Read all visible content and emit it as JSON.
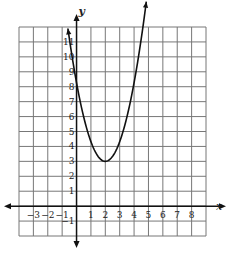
{
  "chart_data": {
    "type": "line",
    "title": "",
    "xlabel": "x",
    "ylabel": "y",
    "function_description": "parabola opening upward with vertex at (2, 3)",
    "vertex": [
      2,
      3
    ],
    "x": [
      -0.6,
      -0.25,
      0,
      0.5,
      1,
      1.5,
      2,
      2.5,
      3,
      3.5,
      4,
      4.5,
      4.85
    ],
    "y": [
      11.9,
      10.0,
      7.0,
      5.25,
      4.0,
      3.25,
      3.0,
      3.25,
      4.0,
      5.25,
      7.0,
      9.25,
      11.9
    ],
    "x_ticks": [
      "-3",
      "-2",
      "-1",
      "1",
      "2",
      "3",
      "4",
      "5",
      "6",
      "7",
      "8"
    ],
    "y_ticks": [
      "-1",
      "1",
      "2",
      "3",
      "4",
      "5",
      "6",
      "7",
      "8",
      "9",
      "10",
      "11"
    ],
    "xlim": [
      -4,
      9
    ],
    "ylim": [
      -2,
      12
    ],
    "grid": true,
    "legend": null
  },
  "labels": {
    "x_axis": "x",
    "y_axis": "y"
  }
}
